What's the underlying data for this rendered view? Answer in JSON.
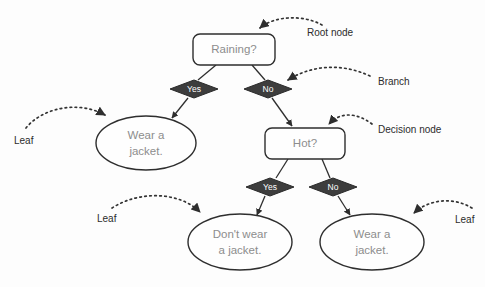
{
  "diagram": {
    "colors": {
      "background": "#fdfdfd",
      "shape_fill": "#fefefe",
      "shape_stroke": "#2e2e2e",
      "diamond_fill": "#3d3d3d",
      "node_text": "#8d8d8d",
      "branch_text": "#ffffff",
      "annotation_text": "#2c2c2c"
    },
    "nodes": {
      "root": {
        "label": "Raining?",
        "type": "decision-node",
        "cx": 234,
        "cy": 49,
        "w": 82,
        "h": 31
      },
      "hot": {
        "label": "Hot?",
        "type": "decision-node",
        "cx": 305,
        "cy": 143,
        "w": 80,
        "h": 31
      },
      "leaf_left": {
        "label_line1": "Wear a",
        "label_line2": "jacket.",
        "type": "leaf",
        "cx": 146,
        "cy": 143,
        "rx": 50,
        "ry": 27
      },
      "leaf_bottom_left": {
        "label_line1": "Don't wear",
        "label_line2": "a jacket.",
        "type": "leaf",
        "cx": 240,
        "cy": 242,
        "rx": 52,
        "ry": 28
      },
      "leaf_bottom_right": {
        "label_line1": "Wear a",
        "label_line2": "jacket.",
        "type": "leaf",
        "cx": 372,
        "cy": 242,
        "rx": 52,
        "ry": 28
      }
    },
    "branches": [
      {
        "label": "Yes",
        "from": "root",
        "to": "leaf_left",
        "cx": 194,
        "cy": 89
      },
      {
        "label": "No",
        "from": "root",
        "to": "hot",
        "cx": 268,
        "cy": 89
      },
      {
        "label": "Yes",
        "from": "hot",
        "to": "leaf_bottom_left",
        "cx": 270,
        "cy": 187
      },
      {
        "label": "No",
        "from": "hot",
        "to": "leaf_bottom_right",
        "cx": 333,
        "cy": 187
      }
    ],
    "annotations": [
      {
        "label": "Root node",
        "x": 307,
        "y": 33,
        "align": "start"
      },
      {
        "label": "Branch",
        "x": 378,
        "y": 82,
        "align": "start"
      },
      {
        "label": "Decision node",
        "x": 378,
        "y": 130,
        "align": "start"
      },
      {
        "label": "Leaf",
        "x": 14,
        "y": 141,
        "align": "start"
      },
      {
        "label": "Leaf",
        "x": 97,
        "y": 219,
        "align": "start"
      },
      {
        "label": "Leaf",
        "x": 455,
        "y": 220,
        "align": "start"
      }
    ]
  }
}
